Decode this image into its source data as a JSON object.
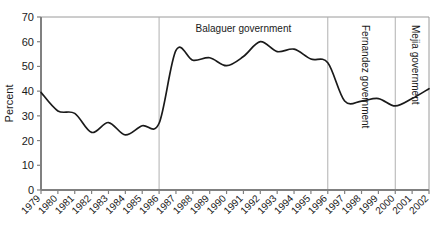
{
  "chart_data": {
    "type": "line",
    "title": "",
    "xlabel": "",
    "ylabel": "Percent",
    "xlim": [
      1979,
      2002
    ],
    "ylim": [
      0,
      70
    ],
    "grid": false,
    "legend": "none",
    "line_color": "#1a1a1a",
    "axis_color": "#808080",
    "divider_color": "#b0b0b0",
    "x": [
      1979,
      1980,
      1981,
      1982,
      1983,
      1984,
      1985,
      1986,
      1987,
      1988,
      1989,
      1990,
      1991,
      1992,
      1993,
      1994,
      1995,
      1996,
      1997,
      1998,
      1999,
      2000,
      2001,
      2002
    ],
    "values": [
      39.5,
      32.0,
      31.0,
      23.3,
      27.3,
      22.3,
      26.0,
      27.0,
      56.5,
      52.5,
      53.5,
      50.3,
      54.0,
      60.0,
      56.0,
      57.0,
      53.0,
      51.5,
      36.0,
      36.0,
      37.0,
      34.0,
      37.0,
      41.0
    ],
    "xticks": [
      "1979",
      "1980",
      "1981",
      "1982",
      "1983",
      "1984",
      "1985",
      "1986",
      "1987",
      "1988",
      "1989",
      "1990",
      "1991",
      "1992",
      "1993",
      "1994",
      "1995",
      "1996",
      "1997",
      "1998",
      "1999",
      "2000",
      "2001",
      "2002"
    ],
    "yticks": [
      "0",
      "10",
      "20",
      "30",
      "40",
      "50",
      "60",
      "70"
    ],
    "ytick_values": [
      0,
      10,
      20,
      30,
      40,
      50,
      60,
      70
    ],
    "annotations": [
      {
        "label": "Balaguer government",
        "orientation": "horizontal",
        "x_start": 1986,
        "x_end": 1996
      },
      {
        "label": "Fernandez government",
        "orientation": "vertical",
        "x_start": 1996,
        "x_end": 2000
      },
      {
        "label": "Mejia government",
        "orientation": "vertical",
        "x_start": 2000,
        "x_end": 2002
      }
    ],
    "dividers": [
      1986,
      1996,
      2000
    ]
  }
}
